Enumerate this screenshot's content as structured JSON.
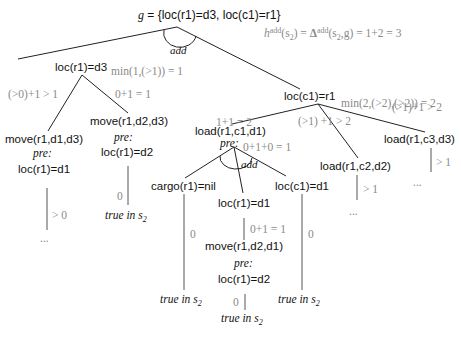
{
  "goal": {
    "g_symbol": "g",
    "equals": " = ",
    "set": "{loc(r1)=d3, loc(c1)=r1}"
  },
  "root_arc_label": "add",
  "heuristic": {
    "h": "h",
    "h_sup": "add",
    "arg_open": "(s",
    "arg_sub": "2",
    "arg_close": ") = ",
    "delta": "Δ",
    "delta_sup": "add",
    "delta_args_open": "(s",
    "delta_args_sub": "2",
    "delta_args_close": ",g) = 1+2 = 3"
  },
  "nodes": {
    "loc_r1_d3": "loc(r1)=d3",
    "loc_c1_r1": "loc(c1)=r1",
    "move_r1_d1_d3": "move(r1,d1,d3)",
    "move_r1_d2_d3": "move(r1,d2,d3)",
    "load_r1_c1_d1": "load(r1,c1,d1)",
    "load_r1_c2_d2": "load(r1,c2,d2)",
    "load_r1_c3_d3": "load(r1,c3,d3)",
    "pre_loc_r1_d1_left": "loc(r1)=d1",
    "pre_loc_r1_d2_left": "loc(r1)=d2",
    "cargo_r1_nil": "cargo(r1)=nil",
    "loc_r1_d1_mid": "loc(r1)=d1",
    "loc_c1_d1": "loc(c1)=d1",
    "move_r1_d2_d1": "move(r1,d2,d1)",
    "pre_loc_r1_d2_bottom": "loc(r1)=d2"
  },
  "labels": {
    "min_left": "min(1,(>1)) = 1",
    "min_right": "min(2,(>2),(>2)) = 2",
    "edge_move_d1": "(>0)+1 > 1",
    "edge_move_d2": "0+1 = 1",
    "edge_load_c1": "1+1 = 2",
    "edge_load_c2": "(>1) +1 > 2",
    "edge_load_c3": "(>1)+1 > 2",
    "load_c1_sum": "0+1+0 = 1",
    "pre_add": "add",
    "pre": "pre:",
    "gt0": "> 0",
    "gt1_c2": "> 1",
    "gt1_c3": "> 1",
    "zero_d2": "0",
    "zero_cargo": "0",
    "zero_locc1": "0",
    "zero_bottom": "0",
    "mid_sum": "0+1 = 1",
    "ellipsis": "...",
    "true_in": "true in s",
    "true_sub": "2"
  },
  "colors": {
    "line": "#222222",
    "annotation": "#8a8a8a",
    "text": "#111111",
    "vline": "#555555"
  }
}
